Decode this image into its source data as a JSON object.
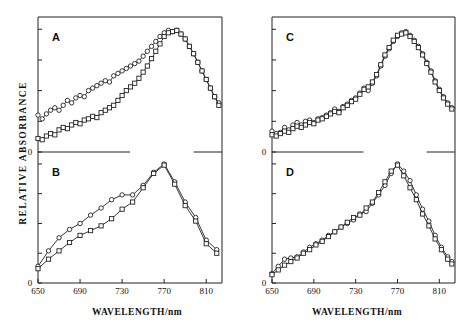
{
  "figure": {
    "xlabel": "WAVELENGTH/nm",
    "ylabel": "RELATIVE  ABSORBANCE",
    "zero_label": "0",
    "zero_label_bottom": "0",
    "xticks": [
      650,
      690,
      730,
      770,
      810
    ],
    "panels": [
      "A",
      "B",
      "C",
      "D"
    ]
  },
  "chart_data": {
    "type": "line",
    "title": "",
    "xlabel": "WAVELENGTH/nm",
    "ylabel": "RELATIVE ABSORBANCE",
    "xlim": [
      650,
      825
    ],
    "grid": false,
    "legend": "none",
    "panels": [
      {
        "name": "A",
        "ylim": [
          0,
          1.05
        ],
        "series": [
          {
            "name": "circles-upper",
            "marker": "circle",
            "x": [
              650,
              654,
              658,
              662,
              666,
              670,
              674,
              678,
              682,
              686,
              690,
              694,
              698,
              702,
              706,
              710,
              714,
              718,
              722,
              726,
              730,
              734,
              738,
              742,
              746,
              750,
              754,
              758,
              762,
              766,
              770,
              774,
              778,
              782,
              786,
              790,
              794,
              798,
              802,
              806,
              810,
              814,
              818,
              822
            ],
            "values": [
              0.3,
              0.27,
              0.31,
              0.34,
              0.36,
              0.34,
              0.38,
              0.42,
              0.4,
              0.44,
              0.46,
              0.45,
              0.5,
              0.52,
              0.54,
              0.56,
              0.58,
              0.57,
              0.62,
              0.64,
              0.66,
              0.68,
              0.7,
              0.72,
              0.74,
              0.78,
              0.82,
              0.86,
              0.9,
              0.94,
              0.97,
              0.99,
              0.98,
              0.99,
              0.96,
              0.92,
              0.86,
              0.8,
              0.73,
              0.66,
              0.59,
              0.52,
              0.45,
              0.4
            ]
          },
          {
            "name": "squares-lower",
            "marker": "square",
            "x": [
              650,
              654,
              658,
              662,
              666,
              670,
              674,
              678,
              682,
              686,
              690,
              694,
              698,
              702,
              706,
              710,
              714,
              718,
              722,
              726,
              730,
              734,
              738,
              742,
              746,
              750,
              754,
              758,
              762,
              766,
              770,
              774,
              778,
              782,
              786,
              790,
              794,
              798,
              802,
              806,
              810,
              814,
              818,
              822
            ],
            "values": [
              0.11,
              0.1,
              0.13,
              0.15,
              0.14,
              0.18,
              0.2,
              0.19,
              0.22,
              0.24,
              0.23,
              0.26,
              0.27,
              0.29,
              0.28,
              0.32,
              0.34,
              0.36,
              0.38,
              0.42,
              0.46,
              0.5,
              0.53,
              0.56,
              0.6,
              0.65,
              0.7,
              0.76,
              0.82,
              0.88,
              0.94,
              0.97,
              0.98,
              0.99,
              0.96,
              0.92,
              0.86,
              0.8,
              0.73,
              0.66,
              0.59,
              0.52,
              0.45,
              0.38
            ]
          }
        ]
      },
      {
        "name": "B",
        "ylim": [
          0,
          1.05
        ],
        "series": [
          {
            "name": "circles-upper",
            "marker": "circle",
            "x": [
              650,
              660,
              670,
              680,
              690,
              700,
              710,
              720,
              730,
              740,
              750,
              760,
              770,
              780,
              790,
              800,
              810,
              820
            ],
            "values": [
              0.14,
              0.27,
              0.38,
              0.45,
              0.5,
              0.57,
              0.63,
              0.7,
              0.74,
              0.74,
              0.82,
              0.93,
              1.0,
              0.85,
              0.68,
              0.55,
              0.36,
              0.28
            ]
          },
          {
            "name": "squares-lower",
            "marker": "square",
            "x": [
              650,
              660,
              670,
              680,
              690,
              700,
              710,
              720,
              730,
              740,
              750,
              760,
              770,
              780,
              790,
              800,
              810,
              820
            ],
            "values": [
              0.12,
              0.2,
              0.27,
              0.34,
              0.4,
              0.44,
              0.48,
              0.54,
              0.62,
              0.68,
              0.8,
              0.92,
              0.99,
              0.83,
              0.65,
              0.52,
              0.33,
              0.25
            ]
          }
        ]
      },
      {
        "name": "C",
        "ylim": [
          0,
          1.05
        ],
        "series": [
          {
            "name": "circles",
            "marker": "circle",
            "x": [
              650,
              654,
              658,
              662,
              666,
              670,
              674,
              678,
              682,
              686,
              690,
              694,
              698,
              702,
              706,
              710,
              714,
              718,
              722,
              726,
              730,
              734,
              738,
              742,
              746,
              750,
              754,
              758,
              762,
              766,
              770,
              774,
              778,
              782,
              786,
              790,
              794,
              798,
              802,
              806,
              810,
              814,
              818,
              822
            ],
            "values": [
              0.17,
              0.15,
              0.16,
              0.2,
              0.18,
              0.22,
              0.24,
              0.22,
              0.25,
              0.26,
              0.24,
              0.27,
              0.28,
              0.3,
              0.32,
              0.35,
              0.33,
              0.37,
              0.39,
              0.42,
              0.44,
              0.48,
              0.52,
              0.5,
              0.56,
              0.62,
              0.7,
              0.78,
              0.84,
              0.9,
              0.94,
              0.97,
              0.98,
              0.95,
              0.91,
              0.86,
              0.8,
              0.73,
              0.66,
              0.58,
              0.51,
              0.45,
              0.4,
              0.36
            ]
          },
          {
            "name": "squares",
            "marker": "square",
            "x": [
              650,
              654,
              658,
              662,
              666,
              670,
              674,
              678,
              682,
              686,
              690,
              694,
              698,
              702,
              706,
              710,
              714,
              718,
              722,
              726,
              730,
              734,
              738,
              742,
              746,
              750,
              754,
              758,
              762,
              766,
              770,
              774,
              778,
              782,
              786,
              790,
              794,
              798,
              802,
              806,
              810,
              814,
              818,
              822
            ],
            "values": [
              0.14,
              0.13,
              0.15,
              0.17,
              0.16,
              0.19,
              0.21,
              0.2,
              0.22,
              0.24,
              0.23,
              0.26,
              0.27,
              0.29,
              0.31,
              0.33,
              0.32,
              0.36,
              0.38,
              0.41,
              0.43,
              0.47,
              0.51,
              0.53,
              0.57,
              0.63,
              0.71,
              0.79,
              0.85,
              0.91,
              0.95,
              0.96,
              0.97,
              0.94,
              0.9,
              0.85,
              0.79,
              0.72,
              0.65,
              0.57,
              0.5,
              0.44,
              0.39,
              0.35
            ]
          }
        ]
      },
      {
        "name": "D",
        "ylim": [
          0,
          1.05
        ],
        "series": [
          {
            "name": "circles",
            "marker": "circle",
            "x": [
              650,
              656,
              662,
              668,
              674,
              680,
              686,
              692,
              698,
              704,
              710,
              716,
              722,
              728,
              734,
              740,
              746,
              752,
              758,
              764,
              770,
              776,
              782,
              788,
              794,
              800,
              806,
              812,
              818,
              822
            ],
            "values": [
              0.08,
              0.14,
              0.2,
              0.21,
              0.22,
              0.26,
              0.3,
              0.33,
              0.36,
              0.4,
              0.43,
              0.47,
              0.5,
              0.53,
              0.58,
              0.6,
              0.67,
              0.74,
              0.82,
              0.92,
              1.0,
              0.94,
              0.86,
              0.74,
              0.62,
              0.52,
              0.4,
              0.3,
              0.22,
              0.18
            ]
          },
          {
            "name": "squares",
            "marker": "square",
            "x": [
              650,
              656,
              662,
              668,
              674,
              680,
              686,
              692,
              698,
              704,
              710,
              716,
              722,
              728,
              734,
              740,
              746,
              752,
              758,
              764,
              770,
              776,
              782,
              788,
              794,
              800,
              806,
              812,
              818,
              822
            ],
            "values": [
              0.07,
              0.11,
              0.15,
              0.18,
              0.21,
              0.25,
              0.28,
              0.32,
              0.35,
              0.39,
              0.43,
              0.47,
              0.51,
              0.55,
              0.57,
              0.63,
              0.68,
              0.76,
              0.85,
              0.94,
              0.99,
              0.9,
              0.8,
              0.7,
              0.58,
              0.48,
              0.37,
              0.28,
              0.2,
              0.16
            ]
          }
        ]
      }
    ]
  }
}
